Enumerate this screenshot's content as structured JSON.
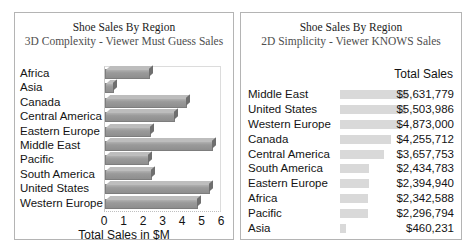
{
  "chart_data": [
    {
      "type": "bar",
      "id": "3d-bar-chart",
      "title": "Shoe Sales By Region",
      "subtitle": "3D Complexity - Viewer Must Guess Sales",
      "orientation": "horizontal",
      "xlabel": "Total Sales in $M",
      "ylabel": "",
      "xlim": [
        0,
        6
      ],
      "xticks": [
        0,
        1,
        2,
        3,
        4,
        5,
        6
      ],
      "xticklabels": [
        "0",
        "1",
        "2",
        "3",
        "4",
        "5",
        "6"
      ],
      "grid": false,
      "legend": false,
      "categories": [
        "Africa",
        "Asia",
        "Canada",
        "Central America",
        "Eastern Europe",
        "Middle East",
        "Pacific",
        "South America",
        "United States",
        "Western Europe"
      ],
      "values": [
        2.34,
        0.46,
        4.26,
        3.66,
        2.39,
        5.63,
        2.3,
        2.43,
        5.5,
        4.87
      ],
      "bar_color": "#9a9a9a"
    },
    {
      "type": "table",
      "id": "2d-table-chart",
      "title": "Shoe Sales By Region",
      "subtitle": "2D Simplicity - Viewer KNOWS Sales",
      "column_header": "Total Sales",
      "grid": false,
      "legend": false,
      "bar_color": "#d9d9d9",
      "xlim": [
        0,
        5631779
      ],
      "categories": [
        "Middle East",
        "United States",
        "Western Europe",
        "Canada",
        "Central America",
        "South America",
        "Eastern Europe",
        "Africa",
        "Pacific",
        "Asia"
      ],
      "values": [
        5631779,
        5503986,
        4873000,
        4255712,
        3657753,
        2434783,
        2394940,
        2342588,
        2296794,
        460231
      ],
      "value_labels": [
        "$5,631,779",
        "$5,503,986",
        "$4,873,000",
        "$4,255,712",
        "$3,657,753",
        "$2,434,783",
        "$2,394,940",
        "$2,342,588",
        "$2,296,794",
        "$460,231"
      ]
    }
  ],
  "panel_left": {
    "title": "Shoe Sales By Region",
    "subtitle": "3D Complexity - Viewer Must Guess Sales",
    "axis_title": "Total Sales in $M"
  },
  "panel_right": {
    "title": "Shoe Sales By Region",
    "subtitle": "2D Simplicity - Viewer KNOWS Sales",
    "column_header": "Total Sales"
  }
}
